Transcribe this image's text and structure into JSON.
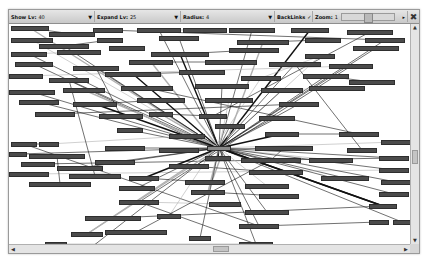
{
  "toolbar": {
    "show_lv": {
      "label": "Show Lv:",
      "value": "40"
    },
    "expand_lv": {
      "label": "Expand Lv:",
      "value": "25"
    },
    "radius": {
      "label": "Radius:",
      "value": "4"
    },
    "backlinks": {
      "label": "BackLinks",
      "checked": true,
      "check_glyph": "✓"
    },
    "zoom": {
      "label": "Zoom:",
      "value": "1"
    },
    "close_glyph": "✖",
    "dropdown_glyph": "▼"
  },
  "graph": {
    "hub_label": "",
    "node_fill": "#4b4b4b",
    "edge_color": "#111111",
    "nodes": [
      {
        "x": 2,
        "y": 2,
        "w": 38
      },
      {
        "x": 40,
        "y": 8,
        "w": 46
      },
      {
        "x": 84,
        "y": 4,
        "w": 30
      },
      {
        "x": 128,
        "y": 4,
        "w": 44
      },
      {
        "x": 174,
        "y": 4,
        "w": 44
      },
      {
        "x": 220,
        "y": 4,
        "w": 46
      },
      {
        "x": 282,
        "y": 4,
        "w": 38
      },
      {
        "x": 338,
        "y": 6,
        "w": 46
      },
      {
        "x": 2,
        "y": 14,
        "w": 42
      },
      {
        "x": 30,
        "y": 20,
        "w": 50
      },
      {
        "x": 88,
        "y": 14,
        "w": 26
      },
      {
        "x": 150,
        "y": 12,
        "w": 40
      },
      {
        "x": 228,
        "y": 16,
        "w": 52
      },
      {
        "x": 296,
        "y": 14,
        "w": 36
      },
      {
        "x": 356,
        "y": 14,
        "w": 40
      },
      {
        "x": 2,
        "y": 28,
        "w": 36
      },
      {
        "x": 48,
        "y": 26,
        "w": 44
      },
      {
        "x": 100,
        "y": 22,
        "w": 36
      },
      {
        "x": 142,
        "y": 28,
        "w": 58
      },
      {
        "x": 220,
        "y": 24,
        "w": 50
      },
      {
        "x": 296,
        "y": 30,
        "w": 30
      },
      {
        "x": 344,
        "y": 22,
        "w": 46
      },
      {
        "x": 6,
        "y": 38,
        "w": 38
      },
      {
        "x": 64,
        "y": 42,
        "w": 46
      },
      {
        "x": 120,
        "y": 36,
        "w": 44
      },
      {
        "x": 196,
        "y": 36,
        "w": 52
      },
      {
        "x": 260,
        "y": 38,
        "w": 52
      },
      {
        "x": 320,
        "y": 40,
        "w": 44
      },
      {
        "x": 0,
        "y": 50,
        "w": 34
      },
      {
        "x": 40,
        "y": 54,
        "w": 40
      },
      {
        "x": 96,
        "y": 48,
        "w": 56
      },
      {
        "x": 170,
        "y": 46,
        "w": 46
      },
      {
        "x": 232,
        "y": 52,
        "w": 40
      },
      {
        "x": 294,
        "y": 50,
        "w": 46
      },
      {
        "x": 340,
        "y": 56,
        "w": 46
      },
      {
        "x": 0,
        "y": 66,
        "w": 46
      },
      {
        "x": 54,
        "y": 64,
        "w": 42
      },
      {
        "x": 112,
        "y": 62,
        "w": 52
      },
      {
        "x": 186,
        "y": 60,
        "w": 54
      },
      {
        "x": 252,
        "y": 64,
        "w": 42
      },
      {
        "x": 300,
        "y": 62,
        "w": 56
      },
      {
        "x": 10,
        "y": 76,
        "w": 40
      },
      {
        "x": 64,
        "y": 78,
        "w": 44
      },
      {
        "x": 128,
        "y": 74,
        "w": 48
      },
      {
        "x": 196,
        "y": 74,
        "w": 48
      },
      {
        "x": 270,
        "y": 78,
        "w": 40
      },
      {
        "x": 26,
        "y": 88,
        "w": 40
      },
      {
        "x": 90,
        "y": 90,
        "w": 44
      },
      {
        "x": 140,
        "y": 88,
        "w": 24
      },
      {
        "x": 190,
        "y": 90,
        "w": 28
      },
      {
        "x": 250,
        "y": 92,
        "w": 36
      },
      {
        "x": 108,
        "y": 104,
        "w": 26
      },
      {
        "x": 160,
        "y": 110,
        "w": 36
      },
      {
        "x": 206,
        "y": 100,
        "w": 30
      },
      {
        "x": 256,
        "y": 108,
        "w": 34
      },
      {
        "x": 330,
        "y": 108,
        "w": 40
      },
      {
        "x": 372,
        "y": 116,
        "w": 30
      },
      {
        "x": 2,
        "y": 118,
        "w": 26
      },
      {
        "x": 30,
        "y": 118,
        "w": 20
      },
      {
        "x": 96,
        "y": 122,
        "w": 40
      },
      {
        "x": 150,
        "y": 124,
        "w": 40
      },
      {
        "x": 246,
        "y": 122,
        "w": 58
      },
      {
        "x": 338,
        "y": 124,
        "w": 30
      },
      {
        "x": 0,
        "y": 128,
        "w": 18
      },
      {
        "x": 20,
        "y": 130,
        "w": 56
      },
      {
        "x": 86,
        "y": 136,
        "w": 40
      },
      {
        "x": 196,
        "y": 132,
        "w": 26
      },
      {
        "x": 232,
        "y": 134,
        "w": 60
      },
      {
        "x": 300,
        "y": 134,
        "w": 44
      },
      {
        "x": 370,
        "y": 132,
        "w": 30
      },
      {
        "x": 12,
        "y": 138,
        "w": 34
      },
      {
        "x": 48,
        "y": 142,
        "w": 46
      },
      {
        "x": 160,
        "y": 140,
        "w": 40
      },
      {
        "x": 240,
        "y": 146,
        "w": 54
      },
      {
        "x": 312,
        "y": 152,
        "w": 48
      },
      {
        "x": 370,
        "y": 144,
        "w": 30
      },
      {
        "x": 0,
        "y": 148,
        "w": 40
      },
      {
        "x": 60,
        "y": 150,
        "w": 52
      },
      {
        "x": 120,
        "y": 152,
        "w": 30
      },
      {
        "x": 176,
        "y": 156,
        "w": 40
      },
      {
        "x": 236,
        "y": 160,
        "w": 44
      },
      {
        "x": 372,
        "y": 156,
        "w": 30
      },
      {
        "x": 20,
        "y": 158,
        "w": 62
      },
      {
        "x": 110,
        "y": 162,
        "w": 36
      },
      {
        "x": 182,
        "y": 166,
        "w": 34
      },
      {
        "x": 250,
        "y": 170,
        "w": 40
      },
      {
        "x": 370,
        "y": 168,
        "w": 30
      },
      {
        "x": 110,
        "y": 176,
        "w": 40
      },
      {
        "x": 200,
        "y": 178,
        "w": 32
      },
      {
        "x": 236,
        "y": 186,
        "w": 44
      },
      {
        "x": 360,
        "y": 180,
        "w": 28
      },
      {
        "x": 76,
        "y": 192,
        "w": 56
      },
      {
        "x": 148,
        "y": 190,
        "w": 24
      },
      {
        "x": 230,
        "y": 200,
        "w": 40
      },
      {
        "x": 360,
        "y": 196,
        "w": 20
      },
      {
        "x": 384,
        "y": 196,
        "w": 18
      },
      {
        "x": 62,
        "y": 208,
        "w": 32
      },
      {
        "x": 96,
        "y": 206,
        "w": 62
      },
      {
        "x": 180,
        "y": 212,
        "w": 22
      },
      {
        "x": 230,
        "y": 218,
        "w": 34
      },
      {
        "x": 36,
        "y": 218,
        "w": 22
      },
      {
        "x": 60,
        "y": 220,
        "w": 48
      }
    ],
    "hub": {
      "x": 198,
      "y": 122,
      "w": 24
    }
  },
  "scrollbars": {
    "up_glyph": "▲",
    "down_glyph": "▼",
    "left_glyph": "◀",
    "right_glyph": "▶"
  }
}
